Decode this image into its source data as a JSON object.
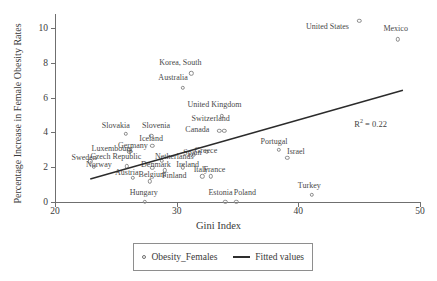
{
  "chart_data": {
    "type": "scatter",
    "title": "",
    "xlabel": "Gini Index",
    "ylabel": "Percentage Increase in Female Obesity Rates",
    "xlim": [
      20,
      50
    ],
    "ylim": [
      0,
      10.8
    ],
    "xticks": [
      20,
      30,
      40,
      50
    ],
    "yticks": [
      0,
      2,
      4,
      6,
      8,
      10
    ],
    "grid": false,
    "annotation": "R2 = 0.22",
    "annotation_r2_value": "0.22",
    "legend_position": "below-axes",
    "series": [
      {
        "name": "Obesity_Females",
        "marker": "open-circle",
        "points": [
          {
            "label": "United States",
            "x": 45.0,
            "y": 10.4,
            "lx": 42.4,
            "ly": 10.1
          },
          {
            "label": "Mexico",
            "x": 48.2,
            "y": 9.35,
            "lx": 48.0,
            "ly": 10.0
          },
          {
            "label": "Korea, South",
            "x": 31.2,
            "y": 7.4,
            "lx": 30.3,
            "ly": 8.05
          },
          {
            "label": "Australia",
            "x": 30.5,
            "y": 6.55,
            "lx": 29.7,
            "ly": 7.2
          },
          {
            "label": "United Kingdom",
            "x": 33.7,
            "y": 4.95,
            "lx": 33.1,
            "ly": 5.65
          },
          {
            "label": "Switzerland",
            "x": 33.5,
            "y": 4.1,
            "lx": 32.8,
            "ly": 4.85
          },
          {
            "label": "Canada",
            "x": 33.9,
            "y": 4.1,
            "lx": 31.7,
            "ly": 4.22
          },
          {
            "label": "Slovakia",
            "x": 25.8,
            "y": 3.92,
            "lx": 25.0,
            "ly": 4.45
          },
          {
            "label": "Slovenia",
            "x": 27.9,
            "y": 3.82,
            "lx": 28.3,
            "ly": 4.4
          },
          {
            "label": "Iceland",
            "x": 28.0,
            "y": 3.22,
            "lx": 27.9,
            "ly": 3.7
          },
          {
            "label": "Germany",
            "x": 26.1,
            "y": 3.0,
            "lx": 26.4,
            "ly": 3.28
          },
          {
            "label": "Luxembourg",
            "x": 26.1,
            "y": 2.88,
            "lx": 24.7,
            "ly": 3.12
          },
          {
            "label": "Spain",
            "x": 31.4,
            "y": 2.72,
            "lx": 31.3,
            "ly": 2.88
          },
          {
            "label": "Greece",
            "x": 32.5,
            "y": 2.9,
            "lx": 32.4,
            "ly": 2.98
          },
          {
            "label": "Portugal",
            "x": 38.4,
            "y": 3.0,
            "lx": 38.0,
            "ly": 3.5
          },
          {
            "label": "Israel",
            "x": 39.1,
            "y": 2.55,
            "lx": 39.8,
            "ly": 2.95
          },
          {
            "label": "Netherlands",
            "x": 28.8,
            "y": 2.38,
            "lx": 29.8,
            "ly": 2.62
          },
          {
            "label": "Czech Republic",
            "x": 25.9,
            "y": 2.05,
            "lx": 25.0,
            "ly": 2.62
          },
          {
            "label": "Sweden",
            "x": 22.9,
            "y": 2.35,
            "lx": 22.4,
            "ly": 2.58
          },
          {
            "label": "Norway",
            "x": 23.2,
            "y": 2.02,
            "lx": 23.6,
            "ly": 2.2
          },
          {
            "label": "Denmark",
            "x": 28.0,
            "y": 1.95,
            "lx": 28.3,
            "ly": 2.18
          },
          {
            "label": "Ireland",
            "x": 30.5,
            "y": 2.0,
            "lx": 30.9,
            "ly": 2.18
          },
          {
            "label": "Austria",
            "x": 26.4,
            "y": 1.38,
            "lx": 25.9,
            "ly": 1.75
          },
          {
            "label": "Belgium",
            "x": 27.8,
            "y": 1.18,
            "lx": 28.0,
            "ly": 1.6
          },
          {
            "label": "Finland",
            "x": 29.0,
            "y": 1.82,
            "lx": 29.8,
            "ly": 1.58
          },
          {
            "label": "Italy",
            "x": 32.1,
            "y": 1.48,
            "lx": 32.0,
            "ly": 1.88
          },
          {
            "label": "France",
            "x": 32.8,
            "y": 1.48,
            "lx": 33.1,
            "ly": 1.88
          },
          {
            "label": "Hungary",
            "x": 27.4,
            "y": 0.02,
            "lx": 27.3,
            "ly": 0.6
          },
          {
            "label": "Estonia",
            "x": 34.0,
            "y": 0.02,
            "lx": 33.6,
            "ly": 0.6
          },
          {
            "label": "Poland",
            "x": 34.9,
            "y": 0.02,
            "lx": 35.6,
            "ly": 0.6
          },
          {
            "label": "Turkey",
            "x": 41.1,
            "y": 0.42,
            "lx": 40.9,
            "ly": 0.95
          }
        ]
      },
      {
        "name": "Fitted values",
        "type": "line",
        "x0": 22.9,
        "y0": 1.32,
        "x1": 48.6,
        "y1": 6.42
      }
    ]
  },
  "legend": {
    "scatter_label": "Obesity_Females",
    "line_label": "Fitted values"
  }
}
